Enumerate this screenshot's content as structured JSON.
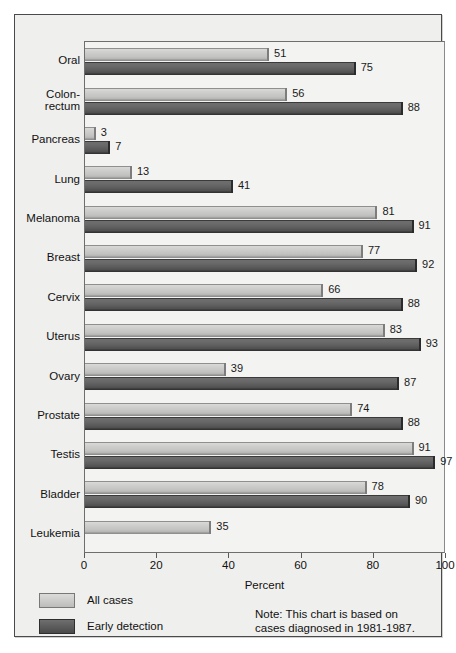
{
  "chart_data": {
    "type": "bar",
    "orientation": "horizontal",
    "title": "",
    "xlabel": "Percent",
    "ylabel": "",
    "xlim": [
      0,
      100
    ],
    "xticks": [
      0,
      20,
      40,
      60,
      80,
      100
    ],
    "grid": false,
    "legend_position": "bottom-left",
    "categories": [
      "Oral",
      "Colon-\nrectum",
      "Pancreas",
      "Lung",
      "Melanoma",
      "Breast",
      "Cervix",
      "Uterus",
      "Ovary",
      "Prostate",
      "Testis",
      "Bladder",
      "Leukemia"
    ],
    "series": [
      {
        "name": "All cases",
        "color": "#c8c8c6",
        "values": [
          51,
          56,
          3,
          13,
          81,
          77,
          66,
          83,
          39,
          74,
          91,
          78,
          35
        ]
      },
      {
        "name": "Early detection",
        "color": "#5a5a5a",
        "values": [
          75,
          88,
          7,
          41,
          91,
          92,
          88,
          93,
          87,
          88,
          97,
          90,
          null
        ]
      }
    ],
    "annotations": {
      "note": "Note: This chart is based on\ncases diagnosed in 1981-1987."
    }
  },
  "legend": {
    "items": [
      {
        "label": "All cases",
        "swatch": "light"
      },
      {
        "label": "Early detection",
        "swatch": "dark"
      }
    ]
  },
  "axis": {
    "x_title": "Percent",
    "tick_labels": [
      "0",
      "20",
      "40",
      "60",
      "80",
      "100"
    ]
  },
  "note": {
    "text": "Note: This chart is based on\ncases diagnosed in 1981-1987."
  },
  "colors": {
    "page_background": "#ffffff",
    "panel_background": "#efefed",
    "plot_background": "#f3f3f1",
    "frame_border": "#4a4a4a",
    "axis_line": "#6e6e6e",
    "all_cases_bar": "#c8c8c6",
    "early_detection_bar": "#5a5a5a",
    "text": "#111111"
  }
}
